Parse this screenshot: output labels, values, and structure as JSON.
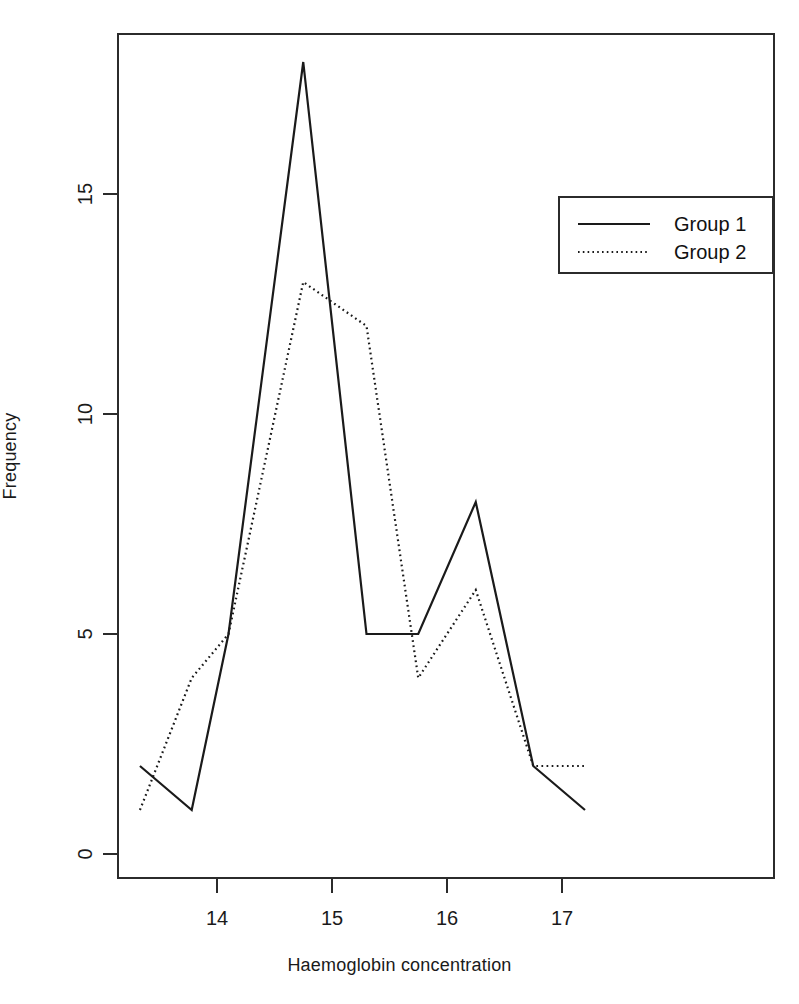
{
  "chart_data": {
    "type": "line",
    "title": "",
    "xlabel": "Haemoglobin concentration",
    "ylabel": "Frequency",
    "xlim": [
      13.13,
      18.75
    ],
    "ylim": [
      0,
      18.6
    ],
    "xticks": [
      14,
      15,
      16,
      17
    ],
    "xtick_labels": [
      "14",
      "15",
      "16",
      "17"
    ],
    "yticks": [
      0,
      5,
      10,
      15
    ],
    "ytick_labels": [
      "0",
      "5",
      "10",
      "15"
    ],
    "grid": false,
    "legend_position": "upper right",
    "series": [
      {
        "name": "Group 1",
        "style": "solid",
        "color": "#1a1a1a",
        "x": [
          13.33,
          13.78,
          14.1,
          14.75,
          15.3,
          15.75,
          16.25,
          16.75,
          17.2
        ],
        "values": [
          2,
          1,
          5,
          18,
          5,
          5,
          8,
          2,
          1
        ]
      },
      {
        "name": "Group 2",
        "style": "dotted",
        "color": "#1a1a1a",
        "x": [
          13.33,
          13.78,
          14.1,
          14.75,
          15.3,
          15.75,
          16.25,
          16.75,
          17.2
        ],
        "values": [
          1,
          4,
          5,
          13,
          12,
          4,
          6,
          2,
          2
        ]
      }
    ]
  },
  "axes": {
    "x_title": "Haemoglobin concentration",
    "y_title": "Frequency",
    "x_tick_labels": [
      "14",
      "15",
      "16",
      "17"
    ],
    "y_tick_labels": [
      "0",
      "5",
      "10",
      "15"
    ]
  },
  "legend": {
    "entries": [
      {
        "label": "Group 1",
        "style": "solid"
      },
      {
        "label": "Group 2",
        "style": "dotted"
      }
    ]
  },
  "colors": {
    "line": "#1a1a1a",
    "frame": "#2b2b2b",
    "background": "#ffffff"
  }
}
